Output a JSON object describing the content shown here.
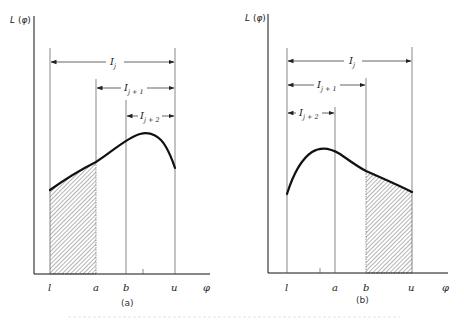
{
  "figure": {
    "panels": [
      {
        "id": "a",
        "caption": "(a)",
        "y_axis_label": "L(φ)",
        "x_axis_symbol": "φ",
        "x_ticks": [
          "l",
          "a",
          "b",
          "u"
        ],
        "intervals": [
          {
            "name": "I_j",
            "base": "I",
            "subscript": "j",
            "from": "l",
            "to": "u"
          },
          {
            "name": "I_j+1",
            "base": "I",
            "subscript": "j + 1",
            "from": "a",
            "to": "u"
          },
          {
            "name": "I_j+2",
            "base": "I",
            "subscript": "j + 2",
            "from": "b",
            "to": "u"
          }
        ],
        "shaded_region": {
          "from": "l",
          "to": "a"
        },
        "curve_description": "unimodal curve rising from l, peaking between b and u, falling to u"
      },
      {
        "id": "b",
        "caption": "(b)",
        "y_axis_label": "L(φ)",
        "x_axis_symbol": "φ",
        "x_ticks": [
          "l",
          "a",
          "b",
          "u"
        ],
        "intervals": [
          {
            "name": "I_j",
            "base": "I",
            "subscript": "j",
            "from": "l",
            "to": "u"
          },
          {
            "name": "I_j+1",
            "base": "I",
            "subscript": "j + 1",
            "from": "l",
            "to": "b"
          },
          {
            "name": "I_j+2",
            "base": "I",
            "subscript": "j + 2",
            "from": "l",
            "to": "a"
          }
        ],
        "shaded_region": {
          "from": "b",
          "to": "u"
        },
        "curve_description": "unimodal curve rising from l, peaking between l and a, decaying to u"
      }
    ]
  },
  "colors": {
    "ink": "#111111",
    "guide_lines": "#555555",
    "hatch": "#444444"
  }
}
